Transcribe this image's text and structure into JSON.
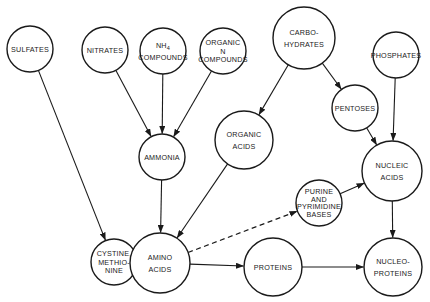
{
  "diagram": {
    "colors": {
      "stroke": "#1a1a1a",
      "fill": "#ffffff",
      "background": "#ffffff"
    },
    "nodes": [
      {
        "id": "sulfates",
        "lines": [
          "SULFATES"
        ],
        "cx": 30,
        "cy": 49,
        "r": 23
      },
      {
        "id": "nitrates",
        "lines": [
          "NITRATES"
        ],
        "cx": 105,
        "cy": 50,
        "r": 23
      },
      {
        "id": "nh4",
        "lines": [
          "NH4",
          "COMPOUNDS"
        ],
        "cx": 163,
        "cy": 51,
        "r": 23
      },
      {
        "id": "organic-n",
        "lines": [
          "ORGANIC",
          "N",
          "COMPOUNDS"
        ],
        "cx": 223,
        "cy": 51,
        "r": 23
      },
      {
        "id": "carbohydrates",
        "lines": [
          "CARBO-",
          "HYDRATES"
        ],
        "cx": 304,
        "cy": 38,
        "r": 31
      },
      {
        "id": "phosphates",
        "lines": [
          "PHOSPHATES"
        ],
        "cx": 396,
        "cy": 55,
        "r": 23
      },
      {
        "id": "pentoses",
        "lines": [
          "PENTOSES"
        ],
        "cx": 355,
        "cy": 108,
        "r": 23
      },
      {
        "id": "ammonia",
        "lines": [
          "AMMONIA"
        ],
        "cx": 162,
        "cy": 157,
        "r": 23
      },
      {
        "id": "organic-acids",
        "lines": [
          "ORGANIC",
          "ACIDS"
        ],
        "cx": 244,
        "cy": 140,
        "r": 29
      },
      {
        "id": "nucleic-acids",
        "lines": [
          "NUCLEIC",
          "ACIDS"
        ],
        "cx": 392,
        "cy": 171,
        "r": 30
      },
      {
        "id": "purine",
        "lines": [
          "PURINE",
          "AND",
          "PYRIMIDINE",
          "BASES"
        ],
        "cx": 319,
        "cy": 203,
        "r": 23
      },
      {
        "id": "cystine",
        "lines": [
          "CYSTINE,",
          "METHIO-",
          "NINE"
        ],
        "cx": 114,
        "cy": 262,
        "r": 23
      },
      {
        "id": "amino-acids",
        "lines": [
          "AMINO",
          "ACIDS"
        ],
        "cx": 160,
        "cy": 263,
        "r": 30
      },
      {
        "id": "proteins",
        "lines": [
          "PROTEINS"
        ],
        "cx": 273,
        "cy": 267,
        "r": 29
      },
      {
        "id": "nucleoproteins",
        "lines": [
          "NUCLEO-",
          "PROTEINS"
        ],
        "cx": 393,
        "cy": 267,
        "r": 29
      }
    ],
    "edges": [
      {
        "from": "sulfates",
        "to": "cystine",
        "style": "solid"
      },
      {
        "from": "nitrates",
        "to": "ammonia",
        "style": "solid"
      },
      {
        "from": "nh4",
        "to": "ammonia",
        "style": "solid"
      },
      {
        "from": "organic-n",
        "to": "ammonia",
        "style": "solid"
      },
      {
        "from": "carbohydrates",
        "to": "organic-acids",
        "style": "solid"
      },
      {
        "from": "carbohydrates",
        "to": "pentoses",
        "style": "solid"
      },
      {
        "from": "pentoses",
        "to": "nucleic-acids",
        "style": "solid"
      },
      {
        "from": "phosphates",
        "to": "nucleic-acids",
        "style": "solid"
      },
      {
        "from": "ammonia",
        "to": "amino-acids",
        "style": "solid"
      },
      {
        "from": "organic-acids",
        "to": "amino-acids",
        "style": "solid"
      },
      {
        "from": "amino-acids",
        "to": "purine",
        "style": "dashed"
      },
      {
        "from": "purine",
        "to": "nucleic-acids",
        "style": "solid"
      },
      {
        "from": "amino-acids",
        "to": "proteins",
        "style": "solid"
      },
      {
        "from": "proteins",
        "to": "nucleoproteins",
        "style": "solid"
      },
      {
        "from": "nucleic-acids",
        "to": "nucleoproteins",
        "style": "solid"
      }
    ]
  }
}
